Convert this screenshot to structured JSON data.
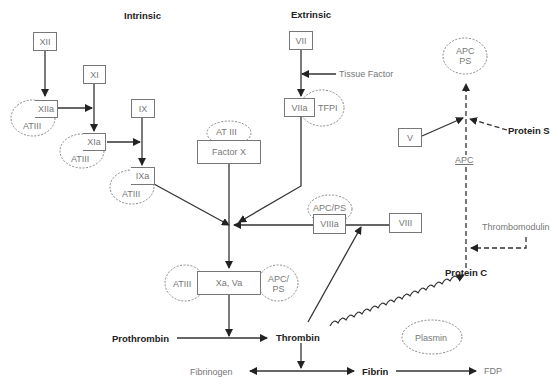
{
  "headers": {
    "intrinsic": "Intrinsic",
    "extrinsic": "Extrinsic"
  },
  "factors": {
    "xii": "XII",
    "xiia": "XIIa",
    "xi": "XI",
    "xia": "XIa",
    "ix": "IX",
    "ixa": "IXa",
    "vii": "VII",
    "viia": "VIIa",
    "factor_x": "Factor X",
    "xa_va": "Xa, Va",
    "viii": "VIII",
    "viiia": "VIIIa",
    "v": "V"
  },
  "inhibitors": {
    "atiii_xiia": "ATIII",
    "atiii_xia": "ATIII",
    "atiii_ixa": "ATIII",
    "at_iii_factor_x": "AT III",
    "tfpi": "TFPI",
    "apc_ps_viiia": "APC/PS",
    "atiii_xa": "ATIII",
    "apc_ps_xa_line1": "APC/",
    "apc_ps_xa_line2": "PS",
    "apc_ps_top_line1": "APC",
    "apc_ps_top_line2": "PS",
    "plasmin": "Plasmin"
  },
  "labels": {
    "tissue_factor": "Tissue Factor",
    "protein_s": "Protein S",
    "apc": "APC",
    "thrombomodulin": "Thrombomodulin",
    "protein_c": "Protein C",
    "prothrombin": "Prothrombin",
    "thrombin": "Thrombin",
    "fibrinogen": "Fibrinogen",
    "fibrin": "Fibrin",
    "fdp": "FDP"
  }
}
